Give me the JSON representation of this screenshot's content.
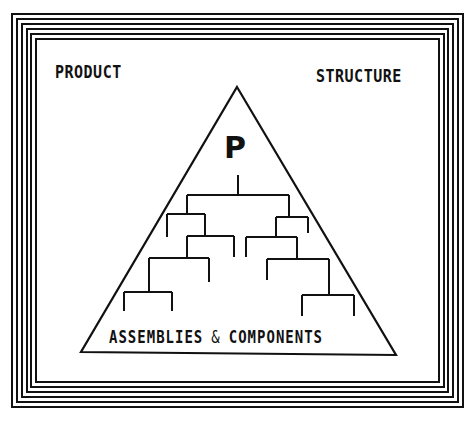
{
  "diagram": {
    "title_left": "PRODUCT",
    "title_right": "STRUCTURE",
    "apex_label": "P",
    "base_label_part1": "ASSEMBLIES",
    "base_label_amp": "&",
    "base_label_part2": "COMPONENTS",
    "shape": "triangle-pyramid",
    "content": "hierarchical tree of product breaking down into assemblies and components",
    "frame": "nested rectangular border with 6 concentric lines",
    "colors": {
      "ink": "#111111",
      "background": "#ffffff"
    }
  }
}
